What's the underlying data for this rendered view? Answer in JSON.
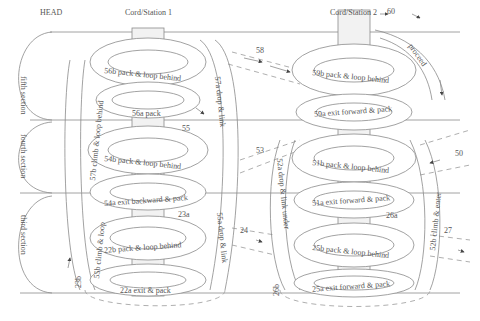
{
  "header": {
    "head_label": "HEAD",
    "station1_label": "Cord/Station 1",
    "station2_label": "Cord/Station 2"
  },
  "sections": [
    {
      "id": "fifth",
      "label": "fifth section"
    },
    {
      "id": "fourth",
      "label": "fourth section"
    },
    {
      "id": "third",
      "label": "third section"
    }
  ],
  "station1": {
    "loops": [
      {
        "id": "56b",
        "label": "56b  pack & loop behind"
      },
      {
        "id": "56a",
        "label": "56a  pack"
      },
      {
        "id": "54b",
        "label": "54b  pack & loop behind"
      },
      {
        "id": "54a",
        "label": "54a  exit backward & pack"
      },
      {
        "id": "22b",
        "label": "22b  pack & loop behind"
      },
      {
        "id": "22a",
        "label": "22a  exit & pack"
      }
    ],
    "verticals": [
      {
        "id": "57b",
        "label": "57b climb & loop behind"
      },
      {
        "id": "57a",
        "label": "57a  drop & link"
      },
      {
        "id": "55b",
        "label": "55b climb & loop"
      },
      {
        "id": "55a",
        "label": "55a  drop & link"
      },
      {
        "id": "23b",
        "label": "23b"
      }
    ],
    "markers": [
      {
        "id": "55",
        "label": "55"
      },
      {
        "id": "23a",
        "label": "23a"
      }
    ]
  },
  "station2": {
    "loops": [
      {
        "id": "59b",
        "label": "59b  pack & loop behind"
      },
      {
        "id": "59a",
        "label": "59a  exit forward & pack"
      },
      {
        "id": "51b",
        "label": "51b  pack & loop behind"
      },
      {
        "id": "51a",
        "label": "51a  exit forward & pack"
      },
      {
        "id": "25b",
        "label": "25b  pack & loop behind"
      },
      {
        "id": "25a",
        "label": "25a  exit forward & pack"
      }
    ],
    "verticals": [
      {
        "id": "52a",
        "label": "52a  drop & link under"
      },
      {
        "id": "52b",
        "label": "52b  climb & enter"
      },
      {
        "id": "26b",
        "label": "26b"
      }
    ],
    "markers": [
      {
        "id": "60",
        "label": "60"
      },
      {
        "id": "proceed",
        "label": "proceed"
      },
      {
        "id": "26a",
        "label": "26a"
      }
    ]
  },
  "connectors": [
    {
      "id": "58",
      "label": "58"
    },
    {
      "id": "53",
      "label": "53"
    },
    {
      "id": "50",
      "label": "50"
    },
    {
      "id": "24",
      "label": "24"
    },
    {
      "id": "27",
      "label": "27"
    }
  ]
}
